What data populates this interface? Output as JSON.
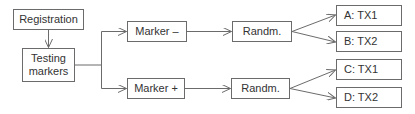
{
  "diagram": {
    "type": "flowchart",
    "nodes": {
      "registration": "Registration",
      "testing_markers": "Testing\nmarkers",
      "testing_markers_line1": "Testing",
      "testing_markers_line2": "markers",
      "marker_neg": "Marker –",
      "marker_pos": "Marker +",
      "randm_neg": "Randm.",
      "randm_pos": "Randm.",
      "arm_a": "A: TX1",
      "arm_b": "B: TX2",
      "arm_c": "C: TX1",
      "arm_d": "D: TX2"
    },
    "edges": [
      [
        "Registration",
        "Testing markers"
      ],
      [
        "Testing markers",
        "Marker –"
      ],
      [
        "Testing markers",
        "Marker +"
      ],
      [
        "Marker –",
        "Randm."
      ],
      [
        "Marker +",
        "Randm."
      ],
      [
        "Randm. (Marker –)",
        "A: TX1"
      ],
      [
        "Randm. (Marker –)",
        "B: TX2"
      ],
      [
        "Randm. (Marker +)",
        "C: TX1"
      ],
      [
        "Randm. (Marker +)",
        "D: TX2"
      ]
    ],
    "colors": {
      "stroke": "#6b6b6b",
      "text": "#333333",
      "background": "#ffffff"
    }
  }
}
